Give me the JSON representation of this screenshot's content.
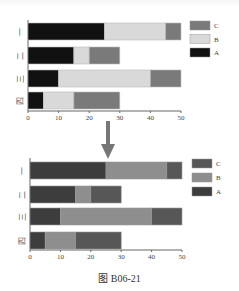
{
  "caption": "图 B06-21",
  "chart_data": [
    {
      "type": "bar",
      "orientation": "horizontal",
      "stacked": true,
      "title": "",
      "xlabel": "",
      "ylabel": "",
      "categories": [
        "一",
        "二",
        "三",
        "四"
      ],
      "series": [
        {
          "name": "A",
          "values": [
            25,
            15,
            10,
            5
          ],
          "color": "#111111"
        },
        {
          "name": "B",
          "values": [
            20,
            5,
            30,
            10
          ],
          "color": "#d9d9d9"
        },
        {
          "name": "C",
          "values": [
            5,
            10,
            10,
            15
          ],
          "color": "#7a7a7a"
        }
      ],
      "xlim": [
        0,
        50
      ],
      "xticks": [
        0,
        10,
        20,
        30,
        40,
        50
      ],
      "grid": false,
      "legend_position": "right",
      "legend_order": [
        "C",
        "B",
        "A"
      ]
    },
    {
      "type": "bar",
      "orientation": "horizontal",
      "stacked": true,
      "title": "",
      "xlabel": "",
      "ylabel": "",
      "categories": [
        "一",
        "二",
        "三",
        "四"
      ],
      "series": [
        {
          "name": "A",
          "values": [
            25,
            15,
            10,
            5
          ],
          "color": "#3d3d3d"
        },
        {
          "name": "B",
          "values": [
            20,
            5,
            30,
            10
          ],
          "color": "#8e8e8e"
        },
        {
          "name": "C",
          "values": [
            5,
            10,
            10,
            15
          ],
          "color": "#575757"
        }
      ],
      "xlim": [
        0,
        50
      ],
      "xticks": [
        0,
        10,
        20,
        30,
        40,
        50
      ],
      "grid": false,
      "legend_position": "right",
      "legend_order": [
        "C",
        "B",
        "A"
      ]
    }
  ],
  "arrow": {
    "direction": "down",
    "color": "#7a7a7a"
  }
}
